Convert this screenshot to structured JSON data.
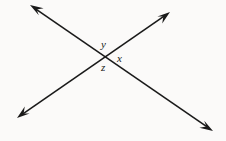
{
  "figure": {
    "canvas": {
      "width": 226,
      "height": 141,
      "background_color": "#fbfaf9"
    },
    "stroke_color": "#1a1a1a",
    "stroke_width": 1.6,
    "intersection_point": {
      "x": 106,
      "y": 57
    },
    "lines": [
      {
        "id": "line-a",
        "description": "double-headed arrow from upper-left to lower-right",
        "start": {
          "x": 30,
          "y": 5
        },
        "end": {
          "x": 213,
          "y": 131
        },
        "arrow_start": true,
        "arrow_end": true
      },
      {
        "id": "line-b",
        "description": "double-headed arrow from lower-left to upper-right",
        "start": {
          "x": 17,
          "y": 118
        },
        "end": {
          "x": 170,
          "y": 12
        },
        "arrow_start": true,
        "arrow_end": true
      }
    ],
    "labels": [
      {
        "id": "label-y",
        "text": "y",
        "position": "above-intersection",
        "x": 101,
        "y": 39
      },
      {
        "id": "label-x",
        "text": "x",
        "position": "right-of-intersection",
        "x": 117,
        "y": 53
      },
      {
        "id": "label-z",
        "text": "z",
        "position": "below-intersection",
        "x": 101,
        "y": 62
      }
    ]
  }
}
